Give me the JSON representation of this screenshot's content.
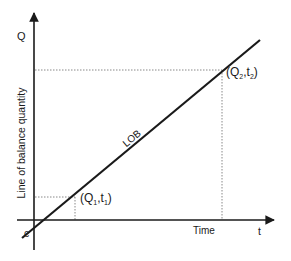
{
  "diagram": {
    "type": "line-of-balance",
    "y_axis_symbol": "Q",
    "y_axis_label": "Line of balance quantity",
    "x_axis_symbol": "t",
    "x_axis_label": "Time",
    "origin_label": "c",
    "line_label": "LOB",
    "points": [
      {
        "q": "Q",
        "q_sub": "1",
        "t": "t",
        "t_sub": "1"
      },
      {
        "q": "Q",
        "q_sub": "2",
        "t": "t",
        "t_sub": "2"
      }
    ],
    "colors": {
      "line": "#1a1a1a",
      "axis": "#1a1a1a",
      "guide": "#888888"
    }
  }
}
